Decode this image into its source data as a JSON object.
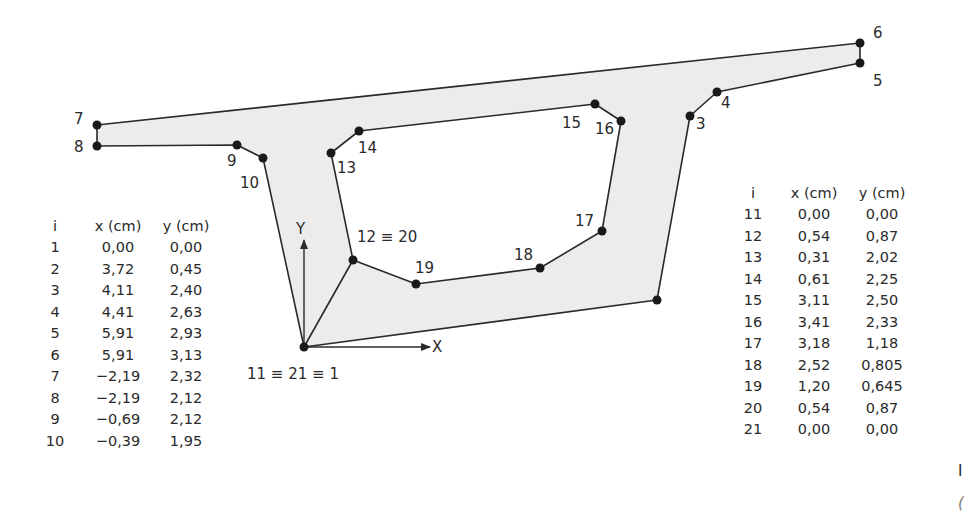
{
  "diagram": {
    "title": "",
    "fill_color": "#ececec",
    "stroke_color": "#2a2a2a",
    "axes": {
      "x_label": "X",
      "y_label": "Y"
    },
    "labels": {
      "p1": "11 ≡ 21 ≡ 1",
      "p3": "3",
      "p4": "4",
      "p5": "5",
      "p6": "6",
      "p7": "7",
      "p8": "8",
      "p9": "9",
      "p10": "10",
      "p12": "12 ≡ 20",
      "p13": "13",
      "p14": "14",
      "p15": "15",
      "p16": "16",
      "p17": "17",
      "p18": "18",
      "p19": "19"
    },
    "outer_contour_order": [
      1,
      2,
      3,
      4,
      5,
      6,
      7,
      8,
      9,
      10,
      11
    ],
    "inner_contour_order": [
      11,
      12,
      13,
      14,
      15,
      16,
      17,
      18,
      19,
      20,
      21
    ]
  },
  "table_left": {
    "headers": [
      "i",
      "x (cm)",
      "y (cm)"
    ],
    "rows": [
      {
        "i": "1",
        "x": "0,00",
        "y": "0,00"
      },
      {
        "i": "2",
        "x": "3,72",
        "y": "0,45"
      },
      {
        "i": "3",
        "x": "4,11",
        "y": "2,40"
      },
      {
        "i": "4",
        "x": "4,41",
        "y": "2,63"
      },
      {
        "i": "5",
        "x": "5,91",
        "y": "2,93"
      },
      {
        "i": "6",
        "x": "5,91",
        "y": "3,13"
      },
      {
        "i": "7",
        "x": "−2,19",
        "y": "2,32"
      },
      {
        "i": "8",
        "x": "−2,19",
        "y": "2,12"
      },
      {
        "i": "9",
        "x": "−0,69",
        "y": "2,12"
      },
      {
        "i": "10",
        "x": "−0,39",
        "y": "1,95"
      }
    ]
  },
  "table_right": {
    "headers": [
      "i",
      "x (cm)",
      "y (cm)"
    ],
    "rows": [
      {
        "i": "11",
        "x": "0,00",
        "y": "0,00"
      },
      {
        "i": "12",
        "x": "0,54",
        "y": "0,87"
      },
      {
        "i": "13",
        "x": "0,31",
        "y": "2,02"
      },
      {
        "i": "14",
        "x": "0,61",
        "y": "2,25"
      },
      {
        "i": "15",
        "x": "3,11",
        "y": "2,50"
      },
      {
        "i": "16",
        "x": "3,41",
        "y": "2,33"
      },
      {
        "i": "17",
        "x": "3,18",
        "y": "1,18"
      },
      {
        "i": "18",
        "x": "2,52",
        "y": "0,805"
      },
      {
        "i": "19",
        "x": "1,20",
        "y": "0,645"
      },
      {
        "i": "20",
        "x": "0,54",
        "y": "0,87"
      },
      {
        "i": "21",
        "x": "0,00",
        "y": "0,00"
      }
    ]
  },
  "edge_fragments": {
    "a": "I",
    "b": "("
  }
}
